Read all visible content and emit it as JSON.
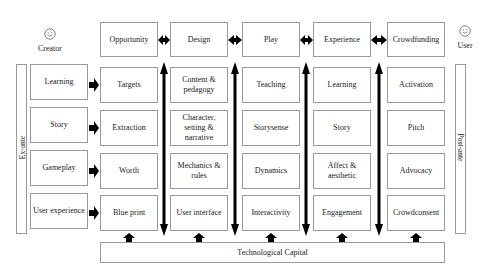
{
  "actors": {
    "creator": {
      "label": "Creator",
      "icon": "smiley-face"
    },
    "user": {
      "label": "User",
      "icon": "smiley-face"
    }
  },
  "side_labels": {
    "left": "Ex-ante",
    "right": "Post-ante"
  },
  "header_row": [
    "Opportunity",
    "Design",
    "Play",
    "Experience",
    "Crowdfunding"
  ],
  "input_column": [
    "Learning",
    "Story",
    "Gameplay",
    "User experience"
  ],
  "columns": [
    {
      "header": "Opportunity",
      "cells": [
        "Targets",
        "Extraction",
        "Worth",
        "Blue print"
      ]
    },
    {
      "header": "Design",
      "cells": [
        "Content & pedagogy",
        "Character, setting & narrative",
        "Mechanics & rules",
        "User interface"
      ]
    },
    {
      "header": "Play",
      "cells": [
        "Teaching",
        "Storysense",
        "Dynamics",
        "Interactivity"
      ]
    },
    {
      "header": "Experience",
      "cells": [
        "Learning",
        "Story",
        "Affect & aesthetic",
        "Engagement"
      ]
    },
    {
      "header": "Crowdfunding",
      "cells": [
        "Activation",
        "Pitch",
        "Advocacy",
        "Crowdconsent"
      ]
    }
  ],
  "foundation": "Technological Capital",
  "colors": {
    "border": "#9a9a9a",
    "arrow": "#000000",
    "text": "#222222"
  }
}
